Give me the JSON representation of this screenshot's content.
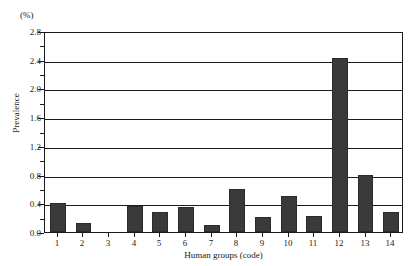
{
  "chart_data": {
    "type": "bar",
    "title": "",
    "subtitle": "",
    "unit_label": "(%)",
    "xlabel": "Human groups (code)",
    "ylabel": "Prevalence",
    "categories": [
      "1",
      "2",
      "3",
      "4",
      "5",
      "6",
      "7",
      "8",
      "9",
      "10",
      "11",
      "12",
      "13",
      "14"
    ],
    "values": [
      0.4,
      0.13,
      0.0,
      0.36,
      0.28,
      0.35,
      0.1,
      0.6,
      0.21,
      0.5,
      0.22,
      2.42,
      0.8,
      0.28
    ],
    "ylim": [
      0.0,
      2.8
    ],
    "xlim_note": "categorical, 14 groups",
    "y_major_ticks": [
      "0.0",
      "0.4",
      "0.8",
      "1.2",
      "1.6",
      "2.0",
      "2.4",
      "2.8"
    ],
    "y_major_values": [
      0.0,
      0.4,
      0.8,
      1.2,
      1.6,
      2.0,
      2.4,
      2.8
    ],
    "y_minor_values": [
      0.2,
      0.6,
      1.0,
      1.4,
      1.8,
      2.2,
      2.6
    ],
    "grid": "horizontal major gridlines only",
    "legend": "none",
    "bar_color": "#3a3a3a",
    "axis_color": "#1a1a1a",
    "background": "#ffffff"
  }
}
